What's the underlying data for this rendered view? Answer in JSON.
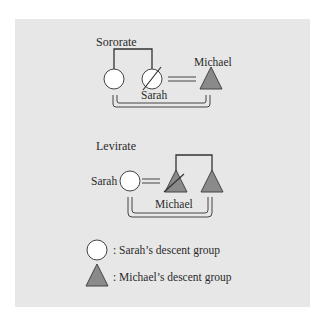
{
  "diagram": {
    "background_color": "#e7e7e7",
    "female_fill": "#ffffff",
    "male_fill": "#8a8a8a",
    "line_color": "#333333",
    "sororate": {
      "title": "Sororate",
      "wife_label": "Sarah",
      "husband_label": "Michael"
    },
    "levirate": {
      "title": "Levirate",
      "wife_label": "Sarah",
      "husband_label": "Michael"
    },
    "legend": {
      "items": [
        {
          "symbol": "circle",
          "label": ":  Sarah’s descent group"
        },
        {
          "symbol": "triangle",
          "label": ":  Michael’s descent group"
        }
      ]
    }
  }
}
